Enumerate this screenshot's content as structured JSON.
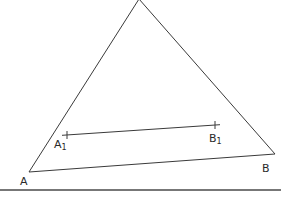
{
  "diagram": {
    "type": "geometry",
    "colors": {
      "line": "#3a3a3a",
      "text": "#2a2a2a",
      "background": "#ffffff"
    },
    "points": {
      "apex": {
        "x": 139,
        "y": -1
      },
      "A": {
        "x": 29,
        "y": 172
      },
      "B": {
        "x": 275,
        "y": 154
      },
      "A1": {
        "x": 67,
        "y": 135
      },
      "B1": {
        "x": 215,
        "y": 125
      }
    },
    "labels": {
      "A": {
        "text": "A",
        "x": 20,
        "y": 185
      },
      "B": {
        "text": "B",
        "x": 262,
        "y": 172
      },
      "A1": {
        "base": "A",
        "sub": "1",
        "x": 54,
        "y": 148
      },
      "B1": {
        "base": "B",
        "sub": "1",
        "x": 209,
        "y": 142
      }
    },
    "segments": [
      {
        "from": "A",
        "to": "apex"
      },
      {
        "from": "apex",
        "to": "B"
      },
      {
        "from": "A",
        "to": "B"
      },
      {
        "from": "A1",
        "to": "B1"
      }
    ],
    "baseline": {
      "x1": 0,
      "y1": 190,
      "x2": 281,
      "y2": 190
    }
  }
}
